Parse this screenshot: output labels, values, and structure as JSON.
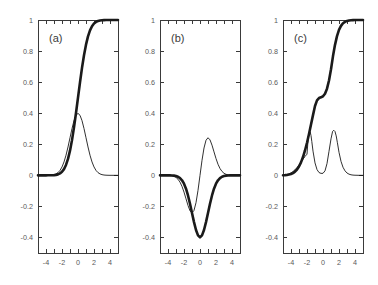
{
  "figure": {
    "background_color": "#ffffff",
    "axis_color": "#3a3a3a",
    "curve_color": "#1a1a1a",
    "tick_label_color": "#5a5a5a",
    "panel_count": 3
  },
  "chart_data": [
    {
      "type": "line",
      "panel_label": "(a)",
      "title": "",
      "xlabel": "",
      "ylabel": "",
      "xlim": [
        -5,
        5
      ],
      "ylim": [
        -0.5,
        1
      ],
      "grid": false,
      "legend_position": "none",
      "xticks": [
        -4,
        -2,
        0,
        2,
        4
      ],
      "xtick_labels": [
        "-4",
        "-2",
        "0",
        "2",
        "4"
      ],
      "xminor_ticks": [
        -5,
        -4,
        -3,
        -2,
        -1,
        0,
        1,
        2,
        3,
        4,
        5
      ],
      "yticks": [
        1,
        0.8,
        0.6,
        0.4,
        0.2,
        0,
        -0.2,
        -0.4
      ],
      "ytick_labels": [
        "1",
        "0.8",
        "0.6",
        "0.4",
        "0.2",
        "0",
        "-0.2",
        "-0.4"
      ],
      "series": [
        {
          "name": "cumulative",
          "line_width": "thick",
          "x": [
            -5,
            -4.75,
            -4.5,
            -4.25,
            -4,
            -3.75,
            -3.5,
            -3.25,
            -3,
            -2.75,
            -2.5,
            -2.25,
            -2,
            -1.75,
            -1.5,
            -1.25,
            -1,
            -0.75,
            -0.5,
            -0.25,
            0,
            0.25,
            0.5,
            0.75,
            1,
            1.25,
            1.5,
            1.75,
            2,
            2.25,
            2.5,
            2.75,
            3,
            3.25,
            3.5,
            3.75,
            4,
            4.25,
            4.5,
            4.75,
            5
          ],
          "values": [
            0.0,
            0.0,
            0.0,
            0.0,
            0.0,
            0.0001,
            0.0002,
            0.0006,
            0.0013,
            0.003,
            0.0062,
            0.0122,
            0.0228,
            0.0401,
            0.0668,
            0.1056,
            0.1587,
            0.2266,
            0.3085,
            0.4013,
            0.5,
            0.5987,
            0.6915,
            0.7734,
            0.8413,
            0.8944,
            0.9332,
            0.9599,
            0.9772,
            0.9878,
            0.9938,
            0.997,
            0.9987,
            0.9994,
            0.9998,
            0.9999,
            1.0,
            1.0,
            1.0,
            1.0,
            1.0
          ]
        },
        {
          "name": "density",
          "line_width": "thin",
          "x": [
            -5,
            -4.75,
            -4.5,
            -4.25,
            -4,
            -3.75,
            -3.5,
            -3.25,
            -3,
            -2.75,
            -2.5,
            -2.25,
            -2,
            -1.75,
            -1.5,
            -1.25,
            -1,
            -0.75,
            -0.5,
            -0.25,
            0,
            0.25,
            0.5,
            0.75,
            1,
            1.25,
            1.5,
            1.75,
            2,
            2.25,
            2.5,
            2.75,
            3,
            3.25,
            3.5,
            3.75,
            4,
            4.25,
            4.5,
            4.75,
            5
          ],
          "values": [
            0.0,
            0.0,
            0.0,
            0.0001,
            0.0001,
            0.0004,
            0.0009,
            0.002,
            0.0044,
            0.0091,
            0.0175,
            0.0317,
            0.054,
            0.0863,
            0.1295,
            0.1826,
            0.242,
            0.3011,
            0.3521,
            0.3867,
            0.3989,
            0.3867,
            0.3521,
            0.3011,
            0.242,
            0.1826,
            0.1295,
            0.0863,
            0.054,
            0.0317,
            0.0175,
            0.0091,
            0.0044,
            0.002,
            0.0009,
            0.0004,
            0.0001,
            0.0001,
            0.0,
            0.0,
            0.0
          ]
        }
      ]
    },
    {
      "type": "line",
      "panel_label": "(b)",
      "title": "",
      "xlabel": "",
      "ylabel": "",
      "xlim": [
        -5,
        5
      ],
      "ylim": [
        -0.5,
        1
      ],
      "grid": false,
      "legend_position": "none",
      "xticks": [
        -4,
        -2,
        0,
        2,
        4
      ],
      "xtick_labels": [
        "-4",
        "-2",
        "0",
        "2",
        "4"
      ],
      "xminor_ticks": [
        -5,
        -4,
        -3,
        -2,
        -1,
        0,
        1,
        2,
        3,
        4,
        5
      ],
      "yticks": [
        1,
        0.8,
        0.6,
        0.4,
        0.2,
        0,
        -0.2,
        -0.4
      ],
      "ytick_labels": [
        "1",
        "0.8",
        "0.6",
        "0.4",
        "0.2",
        "0",
        "-0.2",
        "-0.4"
      ],
      "series": [
        {
          "name": "negative-density",
          "line_width": "thick",
          "x": [
            -5,
            -4.75,
            -4.5,
            -4.25,
            -4,
            -3.75,
            -3.5,
            -3.25,
            -3,
            -2.75,
            -2.5,
            -2.25,
            -2,
            -1.75,
            -1.5,
            -1.25,
            -1,
            -0.75,
            -0.5,
            -0.25,
            0,
            0.25,
            0.5,
            0.75,
            1,
            1.25,
            1.5,
            1.75,
            2,
            2.25,
            2.5,
            2.75,
            3,
            3.25,
            3.5,
            3.75,
            4,
            4.25,
            4.5,
            4.75,
            5
          ],
          "values": [
            0.0,
            0.0,
            0.0,
            -0.0001,
            -0.0001,
            -0.0004,
            -0.0009,
            -0.002,
            -0.0044,
            -0.0091,
            -0.0175,
            -0.0317,
            -0.054,
            -0.0863,
            -0.1295,
            -0.1826,
            -0.242,
            -0.3011,
            -0.3521,
            -0.3867,
            -0.3989,
            -0.3867,
            -0.3521,
            -0.3011,
            -0.242,
            -0.1826,
            -0.1295,
            -0.0863,
            -0.054,
            -0.0317,
            -0.0175,
            -0.0091,
            -0.0044,
            -0.002,
            -0.0009,
            -0.0004,
            -0.0001,
            -0.0001,
            0.0,
            0.0,
            0.0
          ]
        },
        {
          "name": "derivative",
          "line_width": "thin",
          "x": [
            -5,
            -4.75,
            -4.5,
            -4.25,
            -4,
            -3.75,
            -3.5,
            -3.25,
            -3,
            -2.75,
            -2.5,
            -2.25,
            -2,
            -1.75,
            -1.5,
            -1.25,
            -1,
            -0.75,
            -0.5,
            -0.25,
            0,
            0.25,
            0.5,
            0.75,
            1,
            1.25,
            1.5,
            1.75,
            2,
            2.25,
            2.5,
            2.75,
            3,
            3.25,
            3.5,
            3.75,
            4,
            4.25,
            4.5,
            4.75,
            5
          ],
          "values": [
            0.0,
            -0.0001,
            -0.0002,
            -0.0003,
            -0.0005,
            -0.0013,
            -0.0031,
            -0.0066,
            -0.0133,
            -0.0251,
            -0.0438,
            -0.0713,
            -0.108,
            -0.151,
            -0.1943,
            -0.2283,
            -0.242,
            -0.2258,
            -0.176,
            -0.0967,
            0.0,
            0.0967,
            0.176,
            0.2258,
            0.242,
            0.2283,
            0.1943,
            0.151,
            0.108,
            0.0713,
            0.0438,
            0.0251,
            0.0133,
            0.0066,
            0.0031,
            0.0013,
            0.0005,
            0.0003,
            0.0002,
            0.0001,
            0.0
          ]
        }
      ]
    },
    {
      "type": "line",
      "panel_label": "(c)",
      "title": "",
      "xlabel": "",
      "ylabel": "",
      "xlim": [
        -5,
        5
      ],
      "ylim": [
        -0.5,
        1
      ],
      "grid": false,
      "legend_position": "none",
      "xticks": [
        -4,
        -2,
        0,
        2,
        4
      ],
      "xtick_labels": [
        "-4",
        "-2",
        "0",
        "2",
        "4"
      ],
      "xminor_ticks": [
        -5,
        -4,
        -3,
        -2,
        -1,
        0,
        1,
        2,
        3,
        4,
        5
      ],
      "yticks": [
        1,
        0.8,
        0.6,
        0.4,
        0.2,
        0,
        -0.2,
        -0.4
      ],
      "ytick_labels": [
        "1",
        "0.8",
        "0.6",
        "0.4",
        "0.2",
        "0",
        "-0.2",
        "-0.4"
      ],
      "series": [
        {
          "name": "bimodal-cumulative",
          "line_width": "thick",
          "x": [
            -5,
            -4.75,
            -4.5,
            -4.25,
            -4,
            -3.75,
            -3.5,
            -3.25,
            -3,
            -2.75,
            -2.5,
            -2.25,
            -2,
            -1.75,
            -1.5,
            -1.25,
            -1,
            -0.75,
            -0.5,
            -0.25,
            0,
            0.25,
            0.5,
            0.75,
            1,
            1.25,
            1.5,
            1.75,
            2,
            2.25,
            2.5,
            2.75,
            3,
            3.25,
            3.5,
            3.75,
            4,
            4.25,
            4.5,
            4.75,
            5
          ],
          "values": [
            0.0006,
            0.0013,
            0.0026,
            0.0048,
            0.0085,
            0.0145,
            0.0238,
            0.0375,
            0.0569,
            0.0833,
            0.1176,
            0.16,
            0.2101,
            0.2664,
            0.3266,
            0.3877,
            0.4462,
            0.4825,
            0.4976,
            0.5023,
            0.509,
            0.5253,
            0.558,
            0.6108,
            0.683,
            0.7676,
            0.84,
            0.896,
            0.936,
            0.962,
            0.979,
            0.988,
            0.994,
            0.997,
            0.9985,
            0.9993,
            0.9997,
            0.9998,
            0.9999,
            1.0,
            1.0
          ]
        },
        {
          "name": "bimodal-density",
          "line_width": "thin",
          "x": [
            -5,
            -4.75,
            -4.5,
            -4.25,
            -4,
            -3.75,
            -3.5,
            -3.25,
            -3,
            -2.75,
            -2.5,
            -2.25,
            -2,
            -1.9,
            -1.8,
            -1.7,
            -1.6,
            -1.5,
            -1.4,
            -1.25,
            -1,
            -0.75,
            -0.5,
            -0.25,
            0,
            0.25,
            0.5,
            0.75,
            1,
            1.2,
            1.35,
            1.5,
            1.65,
            1.8,
            2,
            2.25,
            2.5,
            2.75,
            3,
            3.25,
            3.5,
            3.75,
            4,
            4.5,
            5
          ],
          "values": [
            0.0018,
            0.0033,
            0.0058,
            0.0098,
            0.0158,
            0.0243,
            0.0357,
            0.05,
            0.0668,
            0.0852,
            0.104,
            0.1216,
            0.1363,
            0.205,
            0.256,
            0.281,
            0.28,
            0.256,
            0.218,
            0.156,
            0.08,
            0.037,
            0.018,
            0.0125,
            0.013,
            0.029,
            0.076,
            0.155,
            0.235,
            0.283,
            0.29,
            0.282,
            0.254,
            0.21,
            0.148,
            0.09,
            0.052,
            0.029,
            0.015,
            0.0075,
            0.0035,
            0.0015,
            0.0007,
            0.0001,
            0.0
          ]
        }
      ]
    }
  ]
}
